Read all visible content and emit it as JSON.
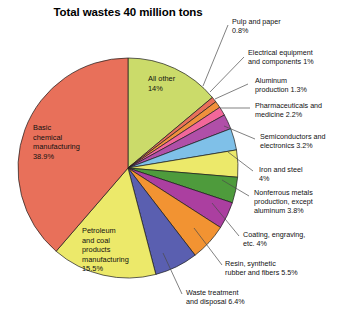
{
  "chart_data": {
    "type": "pie",
    "title": "Total wastes 40 million tons",
    "xlabel": "",
    "ylabel": "",
    "total_label": "40 million tons",
    "legend_position": "callout-labels",
    "grid": false,
    "categories": [
      "All other",
      "Pulp and paper",
      "Electrical equipment and components",
      "Aluminum production",
      "Pharmaceuticals and medicine",
      "Semiconductors and electronics",
      "Iron and steel",
      "Nonferrous metals production, except aluminum",
      "Coating, engraving, etc.",
      "Resin, synthetic rubber and fibers",
      "Waste treatment and disposal",
      "Petroleum and coal products manufacturing",
      "Basic chemical manufacturing"
    ],
    "values": [
      14,
      0.8,
      1,
      1.3,
      2.2,
      3.2,
      4,
      3.8,
      4,
      5.5,
      6.4,
      15.5,
      38.9
    ],
    "colors": [
      "#cbdb6a",
      "#e8705a",
      "#f0903c",
      "#f2679a",
      "#b04fa8",
      "#8c7fd0",
      "#7fc0e8",
      "#ece96a",
      "#4e9b3c",
      "#ab3fa0",
      "#f29332",
      "#5a5fb0",
      "#ece96a",
      "#e8705a"
    ],
    "slices": [
      {
        "label": "All other",
        "percent": 14,
        "value_text": "14%",
        "color": "#cbdb6a",
        "position": "inside"
      },
      {
        "label": "Pulp and paper",
        "percent": 0.8,
        "value_text": "0.8%",
        "color": "#e8705a",
        "position": "callout-right"
      },
      {
        "label": "Electrical equipment and components",
        "percent": 1,
        "value_text": "1%",
        "color": "#f0903c",
        "position": "callout-right"
      },
      {
        "label": "Aluminum production",
        "percent": 1.3,
        "value_text": "1.3%",
        "color": "#f2679a",
        "position": "callout-right"
      },
      {
        "label": "Pharmaceuticals and medicine",
        "percent": 2.2,
        "value_text": "2.2%",
        "color": "#b04fa8",
        "position": "callout-right"
      },
      {
        "label": "Semiconductors and electronics",
        "percent": 3.2,
        "value_text": "3.2%",
        "color": "#7fc0e8",
        "position": "callout-right"
      },
      {
        "label": "Iron and steel",
        "percent": 4,
        "value_text": "4%",
        "color": "#ece96a",
        "position": "callout-right"
      },
      {
        "label": "Nonferrous metals production, except aluminum",
        "percent": 3.8,
        "value_text": "3.8%",
        "color": "#4e9b3c",
        "position": "callout-right"
      },
      {
        "label": "Coating, engraving, etc.",
        "percent": 4,
        "value_text": "4%",
        "color": "#ab3fa0",
        "position": "callout-right"
      },
      {
        "label": "Resin, synthetic rubber and fibers",
        "percent": 5.5,
        "value_text": "5.5%",
        "color": "#f29332",
        "position": "callout-right"
      },
      {
        "label": "Waste treatment and disposal",
        "percent": 6.4,
        "value_text": "6.4%",
        "color": "#5a5fb0",
        "position": "callout-bottom"
      },
      {
        "label": "Petroleum and coal products manufacturing",
        "percent": 15.5,
        "value_text": "15.5%",
        "color": "#ece96a",
        "position": "inside"
      },
      {
        "label": "Basic chemical manufacturing",
        "percent": 38.9,
        "value_text": "38.9%",
        "color": "#e8705a",
        "position": "inside"
      }
    ]
  },
  "labels": {
    "title": "Total wastes 40 million tons",
    "all_other": "All other\n14%",
    "basic_chemical": "Basic\nchemical\nmanufacturing\n38.9%",
    "petroleum": "Petroleum\nand coal\nproducts\nmanufacturing\n15.5%",
    "pulp_and_paper": "Pulp and paper\n0.8%",
    "electrical_equipment": "Electrical equipment\nand components 1%",
    "aluminum": "Aluminum\nproduction 1.3%",
    "pharmaceuticals": "Pharmaceuticals and\nmedicine 2.2%",
    "semiconductors": "Semiconductors and\nelectronics 3.2%",
    "iron_and_steel": "Iron and steel\n   4%",
    "nonferrous": "Nonferrous metals\nproduction, except\naluminum 3.8%",
    "coating": "Coating, engraving,\netc. 4%",
    "resin": "Resin, synthetic\n    rubber and fibers 5.5%",
    "waste_treatment": "Waste treatment\nand disposal 6.4%"
  }
}
